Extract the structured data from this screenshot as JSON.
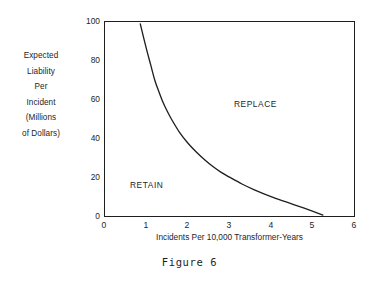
{
  "caption": "Figure 6",
  "chart_data": {
    "type": "line",
    "title": "",
    "subtitle": "",
    "xlabel": "Incidents Per 10,000 Transformer-Years",
    "ylabel_lines": [
      "Expected",
      "Liability",
      "Per",
      "Incident",
      "(Millions",
      "of Dollars)"
    ],
    "ylabel": "Expected Liability Per Incident (Millions of Dollars)",
    "xlim": [
      0,
      6
    ],
    "ylim": [
      0,
      100
    ],
    "xticks": [
      "0",
      "1",
      "2",
      "3",
      "4",
      "5",
      "6"
    ],
    "yticks": [
      "0",
      "20",
      "40",
      "60",
      "80",
      "100"
    ],
    "xtick_values": [
      0,
      1,
      2,
      3,
      4,
      5,
      6
    ],
    "ytick_values": [
      0,
      20,
      40,
      60,
      80,
      100
    ],
    "grid": false,
    "legend": "none",
    "frame": "box",
    "series": [
      {
        "name": "Indifference boundary",
        "description": "Hyperbolic break-even curve separating RETAIN from REPLACE",
        "x": [
          0.85,
          1.0,
          1.1,
          1.2,
          1.3,
          1.4,
          1.5,
          1.6,
          1.8,
          2.0,
          2.2,
          2.4,
          2.6,
          2.8,
          3.0,
          3.3,
          3.6,
          4.0,
          4.4,
          4.8,
          5.25
        ],
        "y": [
          99,
          86,
          78,
          70,
          64,
          58.5,
          54,
          50,
          43,
          37.5,
          33,
          29,
          25.5,
          22.5,
          20,
          16.5,
          13.5,
          10,
          7,
          4,
          0.5
        ]
      }
    ],
    "annotations": [
      {
        "text": "REPLACE",
        "x": 3.1,
        "y": 60
      },
      {
        "text": "RETAIN",
        "x": 0.6,
        "y": 21
      }
    ],
    "colors": {
      "curve": "#1f1f1f",
      "axis": "#1f1f1f",
      "text": "#262626",
      "background": "#ffffff"
    }
  }
}
